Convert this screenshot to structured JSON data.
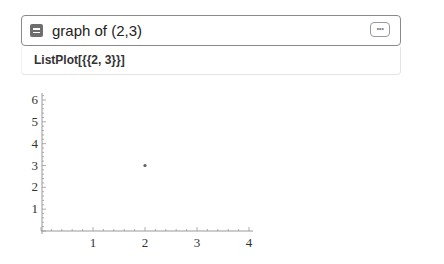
{
  "input": {
    "query": "graph of (2,3)",
    "icon": "collapse-icon",
    "more_label": "•••"
  },
  "output": {
    "expression": "ListPlot[{{2, 3}}]"
  },
  "chart_data": {
    "type": "scatter",
    "title": "",
    "xlabel": "",
    "ylabel": "",
    "x": [
      2
    ],
    "y": [
      3
    ],
    "xlim": [
      0,
      4
    ],
    "ylim": [
      0,
      6
    ],
    "xticks": [
      "1",
      "2",
      "3",
      "4"
    ],
    "yticks": [
      "1",
      "2",
      "3",
      "4",
      "5",
      "6"
    ],
    "grid": false,
    "point_color": "#5e5e5e"
  }
}
